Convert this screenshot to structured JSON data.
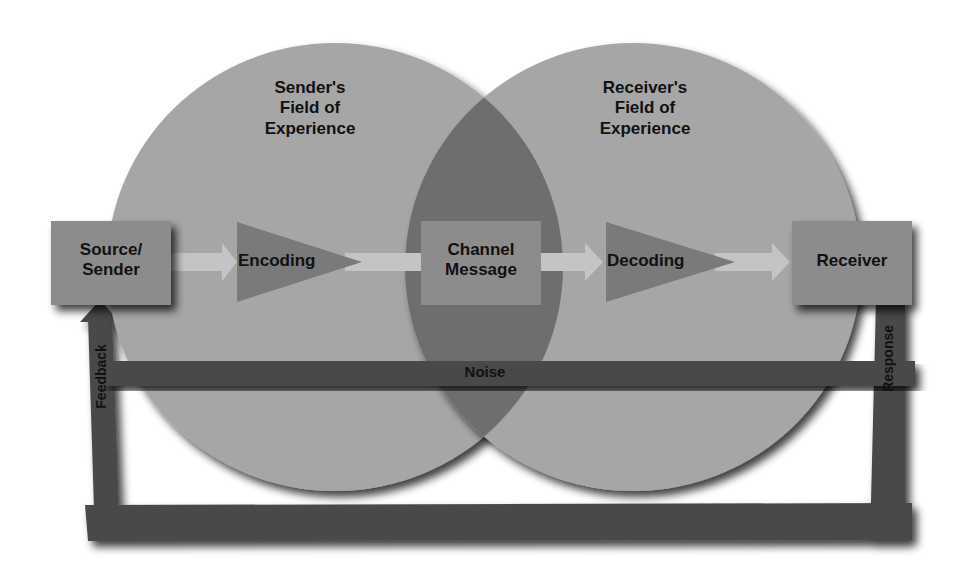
{
  "diagram": {
    "type": "communication-process-model",
    "fields": [
      {
        "id": "sender_field",
        "label_lines": [
          "Sender's",
          "Field of",
          "Experience"
        ]
      },
      {
        "id": "receiver_field",
        "label_lines": [
          "Receiver's",
          "Field of",
          "Experience"
        ]
      }
    ],
    "nodes": [
      {
        "id": "source",
        "label_lines": [
          "Source/",
          "Sender"
        ],
        "shape": "box"
      },
      {
        "id": "encoding",
        "label": "Encoding",
        "shape": "triangle"
      },
      {
        "id": "channel",
        "label_lines": [
          "Channel",
          "Message"
        ],
        "shape": "box"
      },
      {
        "id": "decoding",
        "label": "Decoding",
        "shape": "triangle"
      },
      {
        "id": "receiver",
        "label": "Receiver",
        "shape": "box"
      }
    ],
    "flows": [
      {
        "from": "source",
        "to": "encoding"
      },
      {
        "from": "encoding",
        "to": "channel"
      },
      {
        "from": "channel",
        "to": "decoding"
      },
      {
        "from": "decoding",
        "to": "receiver"
      }
    ],
    "bars": {
      "noise": "Noise",
      "feedback": "Feedback",
      "response": "Response"
    },
    "colors": {
      "circle": "#a6a6a6",
      "overlap": "#6e6e6e",
      "box": "#8c8c8c",
      "triangle": "#7a7a7a",
      "arrow": "#c4c4c4",
      "bar": "#4a4a4a",
      "text": "#111111"
    }
  }
}
